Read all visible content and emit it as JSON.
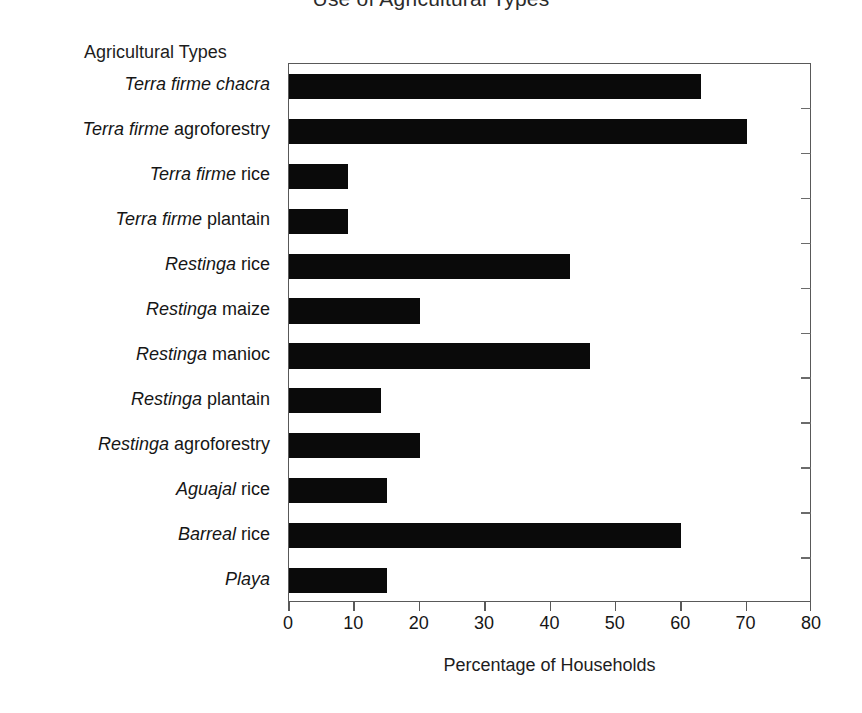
{
  "chart_data": {
    "type": "bar",
    "orientation": "horizontal",
    "title": "Use of Agricultural Types",
    "xlabel": "Percentage of Households",
    "ylabel": "Agricultural Types",
    "xlim": [
      0,
      80
    ],
    "xticks": [
      0,
      10,
      20,
      30,
      40,
      50,
      60,
      70,
      80
    ],
    "xtick_labels": [
      "0",
      "10",
      "20",
      "30",
      "40",
      "50",
      "60",
      "70",
      "80"
    ],
    "grid": false,
    "legend": null,
    "bar_color": "#0a0a0a",
    "categories": [
      "Terra firme chacra",
      "Terra firme agroforestry",
      "Terra firme rice",
      "Terra firme plantain",
      "Restinga rice",
      "Restinga maize",
      "Restinga manioc",
      "Restinga plantain",
      "Restinga agroforestry",
      "Aguajal rice",
      "Barreal rice",
      "Playa"
    ],
    "category_parts": [
      {
        "italic": "Terra firme chacra",
        "roman": ""
      },
      {
        "italic": "Terra firme",
        "roman": "agroforestry"
      },
      {
        "italic": "Terra firme",
        "roman": "rice"
      },
      {
        "italic": "Terra firme",
        "roman": "plantain"
      },
      {
        "italic": "Restinga",
        "roman": "rice"
      },
      {
        "italic": "Restinga",
        "roman": "maize"
      },
      {
        "italic": "Restinga",
        "roman": "manioc"
      },
      {
        "italic": "Restinga",
        "roman": "plantain"
      },
      {
        "italic": "Restinga",
        "roman": "agroforestry"
      },
      {
        "italic": "Aguajal",
        "roman": "rice"
      },
      {
        "italic": "Barreal",
        "roman": "rice"
      },
      {
        "italic": "Playa",
        "roman": ""
      }
    ],
    "values": [
      63,
      70,
      9,
      9,
      43,
      20,
      46,
      14,
      20,
      15,
      60,
      15
    ]
  }
}
